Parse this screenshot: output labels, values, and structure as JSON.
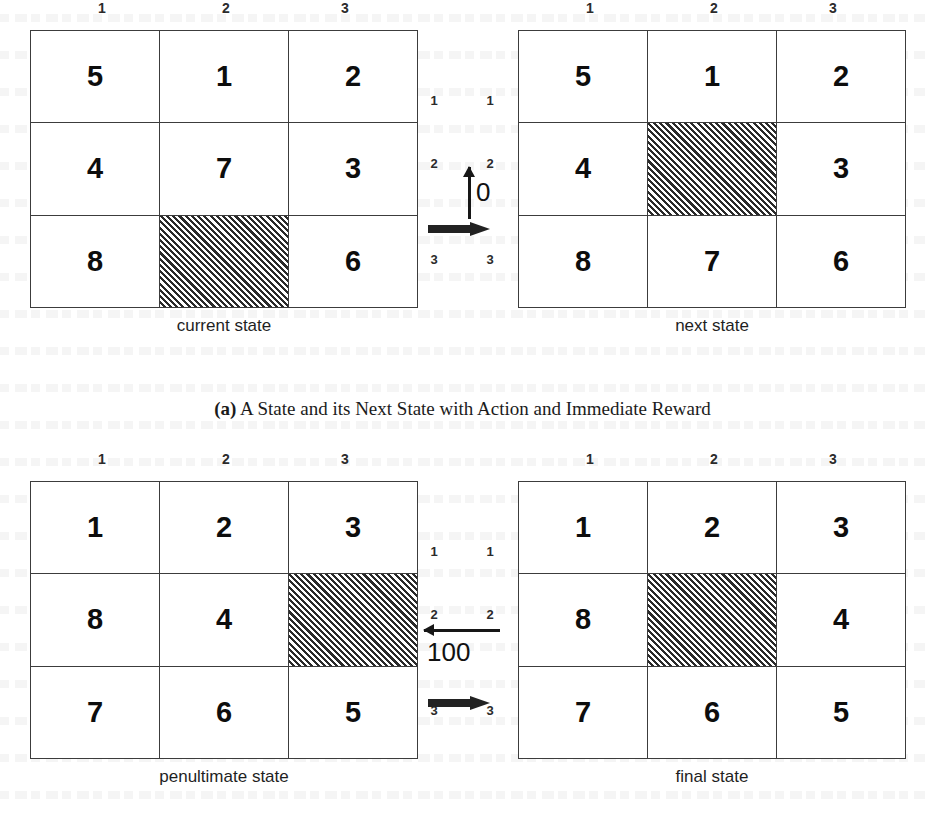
{
  "figure": {
    "caption_a_tag": "(a)",
    "caption_a_text": "A State and its Next State with Action and Immediate Reward"
  },
  "panel_a": {
    "left_grid": {
      "label": "current state",
      "col_headers": [
        "1",
        "2",
        "3"
      ],
      "row_headers": [
        "1",
        "2",
        "3"
      ],
      "cells": [
        [
          "5",
          "1",
          "2"
        ],
        [
          "4",
          "7",
          "3"
        ],
        [
          "8",
          "",
          "6"
        ]
      ],
      "blank_cell": {
        "row": 2,
        "col": 1
      }
    },
    "transition": {
      "row_labels_left": [
        "1",
        "2",
        "3"
      ],
      "row_labels_right": [
        "1",
        "2",
        "3"
      ],
      "action_arrow": "arrow-up-icon",
      "reward": "0",
      "transition_arrow": "thick-arrow-right-icon"
    },
    "right_grid": {
      "label": "next state",
      "col_headers": [
        "1",
        "2",
        "3"
      ],
      "row_headers": [
        "1",
        "2",
        "3"
      ],
      "cells": [
        [
          "5",
          "1",
          "2"
        ],
        [
          "4",
          "",
          "3"
        ],
        [
          "8",
          "7",
          "6"
        ]
      ],
      "blank_cell": {
        "row": 1,
        "col": 1
      }
    }
  },
  "panel_b": {
    "left_grid": {
      "label": "penultimate state",
      "col_headers": [
        "1",
        "2",
        "3"
      ],
      "row_headers": [
        "1",
        "2",
        "3"
      ],
      "cells": [
        [
          "1",
          "2",
          "3"
        ],
        [
          "8",
          "4",
          ""
        ],
        [
          "7",
          "6",
          "5"
        ]
      ],
      "blank_cell": {
        "row": 1,
        "col": 2
      }
    },
    "transition": {
      "row_labels_left": [
        "1",
        "2",
        "3"
      ],
      "row_labels_right": [
        "1",
        "2",
        "3"
      ],
      "action_arrow": "arrow-left-icon",
      "reward": "100",
      "transition_arrow": "thick-arrow-right-icon"
    },
    "right_grid": {
      "label": "final state",
      "col_headers": [
        "1",
        "2",
        "3"
      ],
      "row_headers": [
        "1",
        "2",
        "3"
      ],
      "cells": [
        [
          "1",
          "2",
          "3"
        ],
        [
          "8",
          "",
          "4"
        ],
        [
          "7",
          "6",
          "5"
        ]
      ],
      "blank_cell": {
        "row": 1,
        "col": 1
      }
    }
  },
  "colors": {
    "ink": "#1a1a1a",
    "grid_line": "#3c3c3c",
    "hatch": "#2a2a2a",
    "arrow": "#222222",
    "page": "#ffffff"
  }
}
